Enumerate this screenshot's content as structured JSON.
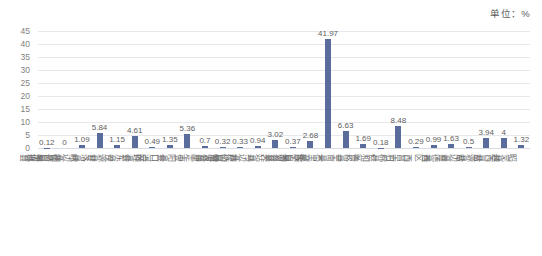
{
  "unit_note": "单位：%",
  "chart_data": {
    "type": "bar",
    "title": "",
    "subtitle": "",
    "xlabel": "",
    "ylabel": "",
    "unit": "%",
    "ylim": [
      0,
      45
    ],
    "yticks": [
      0,
      5,
      10,
      15,
      20,
      25,
      30,
      35,
      40,
      45
    ],
    "grid": true,
    "legend": false,
    "legend_position": "none",
    "bar_color": "#5a6c9c",
    "categories": [
      "布拖县",
      "德昌县",
      "峨边彝族自治县",
      "甘洛县",
      "汉源县",
      "会东县",
      "会理县",
      "金口河区",
      "金阳县",
      "康定市",
      "雷波县",
      "芦山县",
      "马边彝族自治县",
      "美姑县",
      "米易县",
      "冕宁县",
      "木里藏族自治县",
      "宁南县",
      "普格县",
      "仁和区",
      "石棉县",
      "西昌市",
      "西区",
      "喜德县",
      "盐边县",
      "盐源县",
      "越西县",
      "昭觉县"
    ],
    "values": [
      0.12,
      0,
      1.09,
      5.84,
      1.15,
      4.61,
      0.49,
      1.35,
      5.36,
      0.7,
      0.32,
      0.33,
      0.94,
      3.02,
      0.37,
      2.68,
      41.97,
      6.63,
      1.69,
      0.18,
      8.48,
      0.29,
      0.99,
      1.63,
      0.5,
      3.94,
      4,
      1.32
    ],
    "value_labels": [
      "0.12",
      "0",
      "1.09",
      "5.84",
      "1.15",
      "4.61",
      "0.49",
      "1.35",
      "5.36",
      "0.7",
      "0.32",
      "0.33",
      "0.94",
      "3.02",
      "0.37",
      "2.68",
      "41.97",
      "6.63",
      "1.69",
      "0.18",
      "8.48",
      "0.29",
      "0.99",
      "1.63",
      "0.5",
      "3.94",
      "4",
      "1.32"
    ]
  }
}
